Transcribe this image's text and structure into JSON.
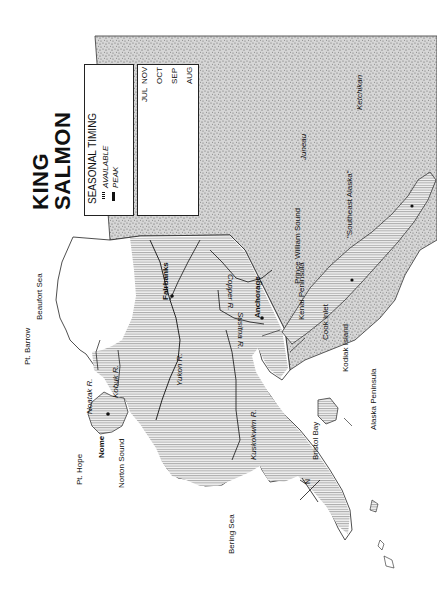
{
  "title": {
    "line1": "KING",
    "line2": "SALMON"
  },
  "legend": {
    "heading": "SEASONAL TIMING",
    "available_label": "AVAILABLE",
    "peak_label": "PEAK",
    "months": [
      "NOV",
      "OCT",
      "SEP",
      "AUG",
      "JUL",
      "JUN",
      "MAY",
      "APR"
    ],
    "available_range": [
      "MAY",
      "JUL"
    ],
    "peak_range": [
      "JUN",
      "JUL"
    ]
  },
  "places": {
    "pt_barrow": "Pt. Barrow",
    "beaufort_sea": "Beaufort Sea",
    "pt_hope": "Pt. Hope",
    "noatak_r": "Noatak R.",
    "kobuk_r": "Kobuk R.",
    "nome": "Nome",
    "norton_sound": "Norton Sound",
    "bering_sea": "Bering Sea",
    "yukon_r": "Yukon R.",
    "fairbanks": "Fairbanks",
    "kuskokwim_r": "Kuskokwim R.",
    "copper_r": "Copper R.",
    "susitna_r": "Susitna R.",
    "anchorage": "Anchorage",
    "prince_william_sound": "Prince William Sound",
    "kenai_peninsula": "Kenai Peninsula",
    "cook_inlet": "Cook Inlet",
    "kodiak_island": "Kodiak Island",
    "bristol_bay": "Bristol Bay",
    "alaska_peninsula": "Alaska Peninsula",
    "southeast_alaska": "\"Southeast Alaska\"",
    "juneau": "Juneau",
    "ketchikan": "Ketchikan",
    "north_arrow": "N"
  },
  "colors": {
    "hatch": "#9a9a9a",
    "stipple": "#7a7a7a",
    "outline": "#222222",
    "background": "#ffffff"
  }
}
